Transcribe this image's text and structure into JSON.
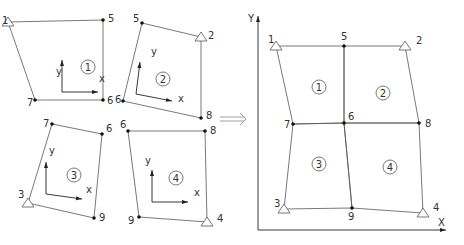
{
  "colors": {
    "line": "#555555",
    "node": "#111111",
    "text": "#333333"
  },
  "left_elements": [
    {
      "id": "1",
      "corners": [
        [
          8,
          22
        ],
        [
          35,
          100
        ],
        [
          103,
          100
        ],
        [
          103,
          20
        ]
      ],
      "node_labels": [
        [
          "1",
          2,
          24
        ],
        [
          "7",
          27,
          106
        ],
        [
          "6",
          107,
          104
        ],
        [
          "5",
          108,
          22
        ]
      ],
      "support": [
        8,
        22
      ],
      "local_axes": {
        "origin": [
          62,
          92
        ],
        "y_label": [
          56,
          75
        ],
        "x_label": [
          99,
          82
        ]
      },
      "center": [
        88,
        67
      ]
    },
    {
      "id": "2",
      "corners": [
        [
          142,
          23
        ],
        [
          123,
          101
        ],
        [
          201,
          118
        ],
        [
          201,
          37
        ]
      ],
      "node_labels": [
        [
          "5",
          133,
          22
        ],
        [
          "6",
          115,
          103
        ],
        [
          "8",
          206,
          119
        ],
        [
          "2",
          208,
          39
        ]
      ],
      "support": [
        201,
        37
      ],
      "local_axes": {
        "origin": [
          136,
          94
        ],
        "y_label": [
          151,
          55
        ],
        "x_label": [
          178,
          102
        ]
      },
      "center": [
        163,
        79
      ]
    },
    {
      "id": "3",
      "corners": [
        [
          52,
          124
        ],
        [
          28,
          203
        ],
        [
          94,
          218
        ],
        [
          102,
          134
        ]
      ],
      "node_labels": [
        [
          "7",
          43,
          127
        ],
        [
          "6",
          106,
          132
        ],
        [
          "9",
          99,
          221
        ],
        [
          "3",
          18,
          198
        ]
      ],
      "support": [
        28,
        203
      ],
      "local_axes": {
        "origin": [
          46,
          194
        ],
        "y_label": [
          49,
          154
        ],
        "x_label": [
          86,
          193
        ]
      },
      "center": [
        74,
        175
      ]
    },
    {
      "id": "4",
      "corners": [
        [
          128,
          131
        ],
        [
          139,
          217
        ],
        [
          207,
          222
        ],
        [
          205,
          131
        ]
      ],
      "node_labels": [
        [
          "6",
          120,
          128
        ],
        [
          "8",
          210,
          134
        ],
        [
          "4",
          217,
          222
        ],
        [
          "9",
          128,
          224
        ]
      ],
      "support": [
        207,
        222
      ],
      "local_axes": {
        "origin": [
          152,
          202
        ],
        "y_label": [
          145,
          164
        ],
        "x_label": [
          194,
          196
        ]
      },
      "center": [
        176,
        178
      ]
    }
  ],
  "right_mesh": {
    "nodes": [
      {
        "id": "1",
        "x": 276,
        "y": 46,
        "label": [
          268,
          43
        ],
        "support": true
      },
      {
        "id": "5",
        "x": 344,
        "y": 46,
        "label": [
          341,
          40
        ],
        "support": false
      },
      {
        "id": "2",
        "x": 405,
        "y": 46,
        "label": [
          416,
          44
        ],
        "support": true
      },
      {
        "id": "7",
        "x": 293,
        "y": 124,
        "label": [
          284,
          128
        ],
        "support": false
      },
      {
        "id": "6",
        "x": 344,
        "y": 123,
        "label": [
          348,
          120
        ],
        "support": false
      },
      {
        "id": "8",
        "x": 419,
        "y": 123,
        "label": [
          425,
          127
        ],
        "support": false
      },
      {
        "id": "3",
        "x": 284,
        "y": 209,
        "label": [
          274,
          207
        ],
        "support": true
      },
      {
        "id": "9",
        "x": 352,
        "y": 208,
        "label": [
          348,
          220
        ],
        "support": false
      },
      {
        "id": "4",
        "x": 423,
        "y": 213,
        "label": [
          433,
          211
        ],
        "support": true
      }
    ],
    "elements": [
      {
        "id": "1",
        "nodes": [
          "1",
          "5",
          "6",
          "7"
        ],
        "center": [
          319,
          87
        ]
      },
      {
        "id": "2",
        "nodes": [
          "5",
          "2",
          "8",
          "6"
        ],
        "center": [
          383,
          93
        ]
      },
      {
        "id": "3",
        "nodes": [
          "7",
          "6",
          "9",
          "3"
        ],
        "center": [
          319,
          164
        ]
      },
      {
        "id": "4",
        "nodes": [
          "6",
          "8",
          "4",
          "9"
        ],
        "center": [
          390,
          167
        ]
      }
    ],
    "axes": {
      "origin": [
        258,
        230
      ],
      "x_end": [
        446,
        230
      ],
      "y_end": [
        258,
        16
      ],
      "x_label": "X",
      "y_label": "Y"
    }
  },
  "local_axis_labels": {
    "x": "x",
    "y": "y"
  },
  "arrow": "implies-arrow"
}
